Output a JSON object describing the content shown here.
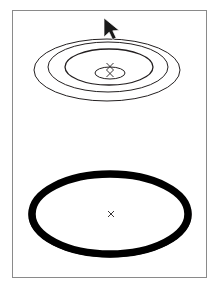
{
  "app": {
    "window_title": "",
    "background_color": "#ffffff",
    "frame_border_color": "#8a8a8a",
    "ink_color": "#231f20"
  },
  "canvas": {
    "label": "drawing-canvas",
    "frame": {
      "x": 12,
      "y": 10,
      "width": 195,
      "height": 268
    }
  },
  "objects": [
    {
      "id": "top-object",
      "label": "concentric-ellipse-rings",
      "style": "wireframe",
      "center": {
        "x": 107,
        "y": 70
      },
      "center_marker": "x",
      "rings": [
        {
          "rx": 73,
          "ry": 31,
          "cx": 107,
          "cy": 70,
          "stroke_width": 1.0
        },
        {
          "rx": 60,
          "ry": 25,
          "cx": 108,
          "cy": 67,
          "stroke_width": 1.0
        },
        {
          "rx": 44,
          "ry": 18,
          "cx": 109,
          "cy": 67,
          "stroke_width": 1.3
        },
        {
          "rx": 15,
          "ry": 6,
          "cx": 110,
          "cy": 73,
          "stroke_width": 1.0
        }
      ]
    },
    {
      "id": "bottom-object",
      "label": "thick-black-ellipse-ring",
      "style": "solid-filled-ring",
      "center": {
        "x": 110,
        "y": 214
      },
      "center_marker": "x",
      "rings": [
        {
          "rx": 81,
          "ry": 42,
          "cx": 110,
          "cy": 215,
          "stroke_width": 1.0
        },
        {
          "rx": 78,
          "ry": 40,
          "cx": 110,
          "cy": 214,
          "stroke_width": 7.5
        }
      ]
    }
  ],
  "cursor": {
    "label": "arrow-pointer",
    "type": "arrow",
    "x": 104,
    "y": 18
  }
}
